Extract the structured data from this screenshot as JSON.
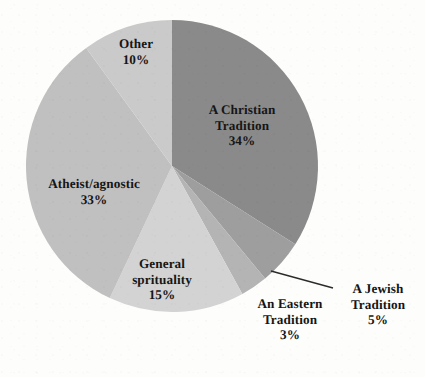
{
  "chart_data": {
    "type": "pie",
    "title": "",
    "subtitle": "",
    "xlabel": "",
    "ylabel": "",
    "legend_position": "none",
    "grid": false,
    "start_angle_deg": 0,
    "direction": "clockwise",
    "categories": [
      "A Christian Tradition",
      "A Jewish Tradition",
      "An Eastern Tradition",
      "General sprituality",
      "Atheist/agnostic",
      "Other"
    ],
    "values": [
      34,
      5,
      3,
      15,
      33,
      10
    ],
    "value_labels": [
      "34%",
      "5%",
      "3%",
      "15%",
      "33%",
      "10%"
    ],
    "colors": [
      "#8a8a8a",
      "#9e9e9e",
      "#b4b4b4",
      "#d3d3d3",
      "#c0c0c0",
      "#cacaca"
    ],
    "slices": [
      {
        "id": "christian",
        "name_lines": "A Christian\nTradition",
        "value_label": "34%",
        "value": 34,
        "color": "#8a8a8a",
        "label_placement": "inside"
      },
      {
        "id": "jewish",
        "name_lines": "A Jewish\nTradition",
        "value_label": "5%",
        "value": 5,
        "color": "#9e9e9e",
        "label_placement": "outside-leader"
      },
      {
        "id": "eastern",
        "name_lines": "An Eastern\nTradition",
        "value_label": "3%",
        "value": 3,
        "color": "#b4b4b4",
        "label_placement": "outside"
      },
      {
        "id": "spirituality",
        "name_lines": "General\nsprituality",
        "value_label": "15%",
        "value": 15,
        "color": "#d3d3d3",
        "label_placement": "inside"
      },
      {
        "id": "atheist",
        "name_lines": "Atheist/agnostic",
        "value_label": "33%",
        "value": 33,
        "color": "#c0c0c0",
        "label_placement": "inside"
      },
      {
        "id": "other",
        "name_lines": "Other",
        "value_label": "10%",
        "value": 10,
        "color": "#cacaca",
        "label_placement": "inside"
      }
    ]
  },
  "figure": {
    "background_color": "#fdfdfb",
    "text_color": "#161616",
    "leader_line_color": "#2b2b2b"
  }
}
